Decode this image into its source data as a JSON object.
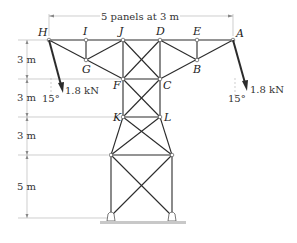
{
  "figure": {
    "top_dimension": "5 panels at 3 m",
    "vertical_dimensions": [
      "3 m",
      "3 m",
      "3 m",
      "5 m"
    ],
    "nodes": {
      "H": "H",
      "I": "I",
      "J": "J",
      "D": "D",
      "E": "E",
      "A": "A",
      "G": "G",
      "B": "B",
      "F": "F",
      "C": "C",
      "K": "K",
      "L": "L"
    },
    "loads": [
      {
        "id": "left",
        "magnitude": "1.8 kN",
        "angle": "15°"
      },
      {
        "id": "right",
        "magnitude": "1.8 kN",
        "angle": "15°"
      }
    ]
  }
}
